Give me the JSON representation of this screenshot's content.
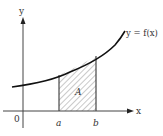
{
  "diagram": {
    "axes": {
      "x_label": "x",
      "y_label": "y",
      "origin_label": "0"
    },
    "curve_label": "y = f(x)",
    "region_label": "A",
    "bounds": {
      "left": "a",
      "right": "b"
    },
    "colors": {
      "stroke": "#222222",
      "hatch": "#666666",
      "background": "#ffffff"
    }
  }
}
